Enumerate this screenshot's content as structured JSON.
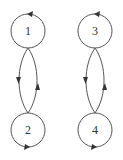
{
  "diagram": {
    "type": "state-transition-graph",
    "components": [
      {
        "nodes": [
          {
            "id": "1",
            "label": "1",
            "self_loop": true
          },
          {
            "id": "2",
            "label": "2",
            "self_loop": true
          }
        ],
        "edges": [
          {
            "from": "1",
            "to": "2"
          },
          {
            "from": "2",
            "to": "1"
          },
          {
            "from": "1",
            "to": "1"
          },
          {
            "from": "2",
            "to": "2"
          }
        ]
      },
      {
        "nodes": [
          {
            "id": "3",
            "label": "3",
            "self_loop": true
          },
          {
            "id": "4",
            "label": "4",
            "self_loop": true
          }
        ],
        "edges": [
          {
            "from": "3",
            "to": "4"
          },
          {
            "from": "4",
            "to": "3"
          },
          {
            "from": "3",
            "to": "3"
          },
          {
            "from": "4",
            "to": "4"
          }
        ]
      }
    ],
    "labels": {
      "n1": "1",
      "n2": "2",
      "n3": "3",
      "n4": "4"
    },
    "colors": {
      "stroke": "#555555",
      "arrow": "#333333",
      "text": "#333333",
      "background": "#ffffff"
    }
  }
}
